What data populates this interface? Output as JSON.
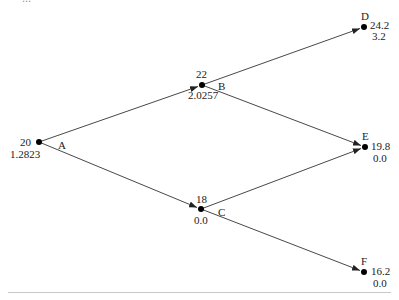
{
  "caption_fragment": "...",
  "diagram": {
    "type": "binomial-tree",
    "nodes": [
      {
        "id": "A",
        "price": "20",
        "value": "1.2823",
        "x": 39,
        "y": 142
      },
      {
        "id": "B",
        "price": "22",
        "value": "2.0257",
        "x": 202,
        "y": 85
      },
      {
        "id": "C",
        "price": "18",
        "value": "0.0",
        "x": 201,
        "y": 209
      },
      {
        "id": "D",
        "price": "24.2",
        "value": "3.2",
        "x": 364,
        "y": 27
      },
      {
        "id": "E",
        "price": "19.8",
        "value": "0.0",
        "x": 365,
        "y": 147
      },
      {
        "id": "F",
        "price": "16.2",
        "value": "0.0",
        "x": 364,
        "y": 272
      }
    ],
    "edges": [
      {
        "from": "A",
        "to": "B"
      },
      {
        "from": "A",
        "to": "C"
      },
      {
        "from": "B",
        "to": "D"
      },
      {
        "from": "B",
        "to": "E"
      },
      {
        "from": "C",
        "to": "E"
      },
      {
        "from": "C",
        "to": "F"
      }
    ],
    "colors": {
      "line": "#333333",
      "node": "#000000",
      "text": "#222222",
      "rule": "#c8c8c8"
    }
  }
}
